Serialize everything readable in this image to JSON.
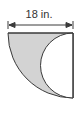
{
  "figure": {
    "dimension_label": "18 in.",
    "shapes": {
      "outer": "quarter-circle",
      "cutout": "semicircle"
    },
    "colors": {
      "fill": "#d3d3d3",
      "stroke": "#3a3a3a",
      "background": "#ffffff"
    }
  }
}
